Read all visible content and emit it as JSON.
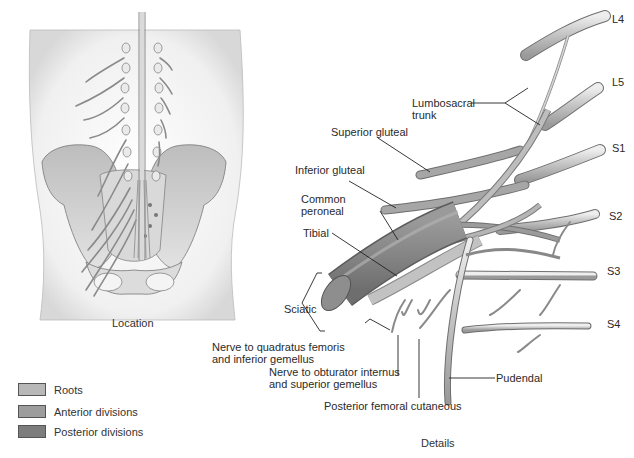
{
  "location_panel": {
    "caption": "Location"
  },
  "details_panel": {
    "caption": "Details",
    "root_labels": [
      "L4",
      "L5",
      "S1",
      "S2",
      "S3",
      "S4"
    ],
    "labels": {
      "lumbosacral_trunk_1": "Lumbosacral",
      "lumbosacral_trunk_2": "trunk",
      "superior_gluteal": "Superior gluteal",
      "inferior_gluteal": "Inferior gluteal",
      "common_peroneal_1": "Common",
      "common_peroneal_2": "peroneal",
      "tibial": "Tibial",
      "sciatic": "Sciatic",
      "quadratus_1": "Nerve to quadratus femoris",
      "quadratus_2": "and inferior gemellus",
      "obturator_1": "Nerve to obturator internus",
      "obturator_2": "and superior gemellus",
      "posterior_femoral": "Posterior femoral cutaneous",
      "pudendal": "Pudendal"
    }
  },
  "legend": {
    "items": [
      {
        "label": "Roots",
        "color": "#b8b8b8"
      },
      {
        "label": "Anterior divisions",
        "color": "#9d9d9d"
      },
      {
        "label": "Posterior divisions",
        "color": "#7d7d7d"
      }
    ]
  },
  "colors": {
    "root": "#c4c4c4",
    "anterior": "#a8a8a8",
    "posterior": "#8a8a8a",
    "bone": "#d6d6d6",
    "body": "#ececec"
  }
}
